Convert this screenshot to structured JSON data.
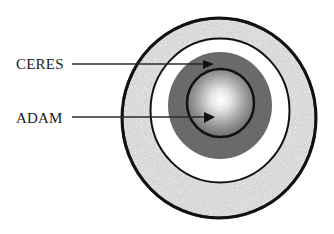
{
  "diagram": {
    "labels": [
      {
        "id": "ceres",
        "text": "CERES",
        "points_to": "gray-ring"
      },
      {
        "id": "adam",
        "text": "ADAM",
        "points_to": "inner-sphere"
      }
    ],
    "layers": [
      {
        "name": "outer-speckled-ring",
        "fill": "#d9d9d9",
        "stroke": "#111111"
      },
      {
        "name": "white-ring",
        "fill": "#ffffff",
        "stroke": "#111111"
      },
      {
        "name": "gray-ring",
        "fill": "#6b6b6b",
        "stroke": "none"
      },
      {
        "name": "inner-sphere",
        "fill_center": "#ffffff",
        "fill_edge": "#6a6a6a",
        "stroke": "#111111"
      }
    ],
    "colors": {
      "line": "#222222",
      "text": "#1a1a1a",
      "background": "#ffffff"
    }
  }
}
